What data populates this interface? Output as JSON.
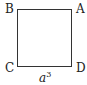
{
  "diagram": {
    "shape": "square",
    "vertices": {
      "top_left": "B",
      "top_right": "A",
      "bottom_left": "C",
      "bottom_right": "D"
    },
    "side_label": {
      "base": "a",
      "exponent": "3"
    },
    "stroke_color": "#333333"
  }
}
